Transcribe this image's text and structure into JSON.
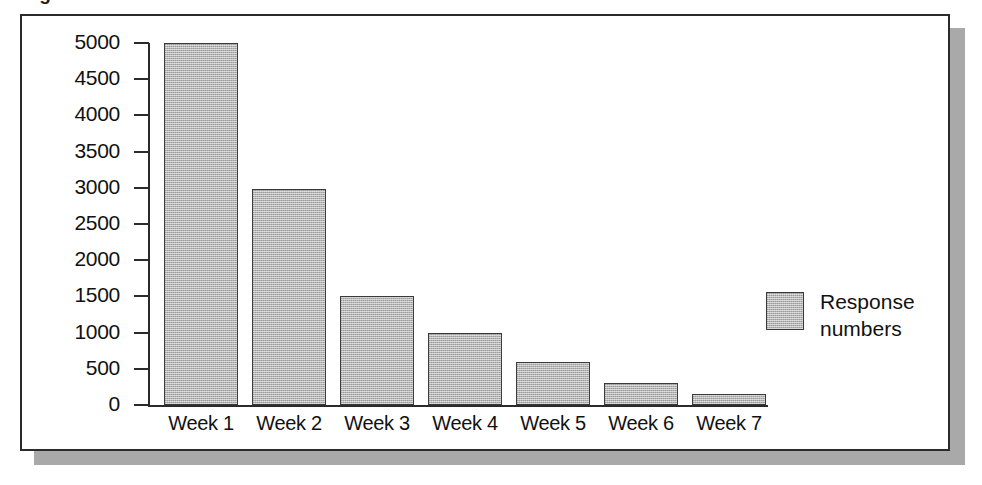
{
  "figure": {
    "title_cropped": "Figure",
    "frame_color": "#2b2b2b",
    "shadow_color": "#a9a9a9",
    "background": "#ffffff"
  },
  "chart_data": {
    "type": "bar",
    "title": "",
    "xlabel": "",
    "ylabel": "",
    "categories": [
      "Week 1",
      "Week 2",
      "Week 3",
      "Week 4",
      "Week 5",
      "Week 6",
      "Week 7"
    ],
    "values": [
      5000,
      2980,
      1500,
      1000,
      600,
      300,
      150
    ],
    "series": [
      {
        "name": "Response numbers",
        "values": [
          5000,
          2980,
          1500,
          1000,
          600,
          300,
          150
        ],
        "color": "#b4b4b4"
      }
    ],
    "ylim": [
      0,
      5000
    ],
    "ytick_step": 500,
    "yticks": [
      5000,
      4500,
      4000,
      3500,
      3000,
      2500,
      2000,
      1500,
      1000,
      500,
      0
    ],
    "ytick_labels": [
      "5000",
      "4500",
      "4000",
      "3500",
      "3000",
      "2500",
      "2000",
      "1500",
      "1000",
      "500",
      "0"
    ],
    "grid": false,
    "legend_position": "right",
    "legend": [
      {
        "label_line1": "Response",
        "label_line2": "numbers",
        "color": "#b4b4b4"
      }
    ]
  }
}
